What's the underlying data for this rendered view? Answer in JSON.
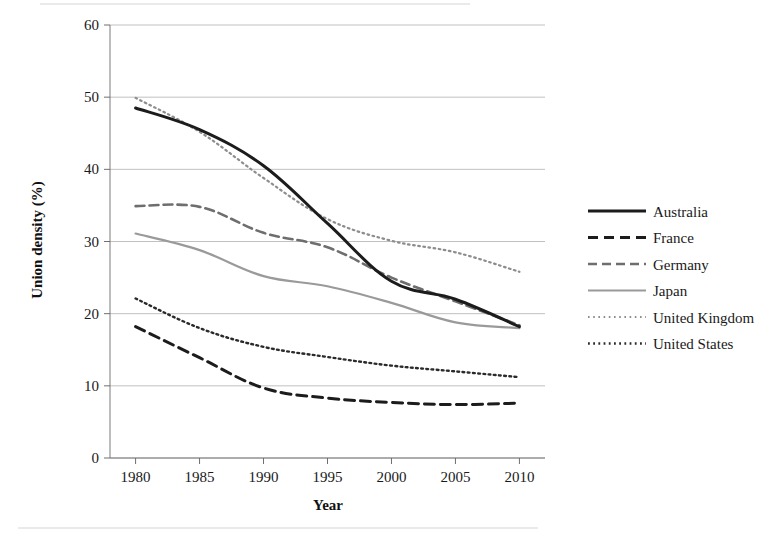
{
  "chart_data": {
    "type": "line",
    "title": "",
    "xlabel": "Year",
    "ylabel": "Union density (%)",
    "x": [
      1980,
      1985,
      1990,
      1995,
      2000,
      2005,
      2010
    ],
    "xlim": [
      1978,
      2012
    ],
    "ylim": [
      0,
      60
    ],
    "xticks": [
      "1980",
      "1985",
      "1990",
      "1995",
      "2000",
      "2005",
      "2010"
    ],
    "yticks": [
      "0",
      "10",
      "20",
      "30",
      "40",
      "50",
      "60"
    ],
    "grid": "horizontal",
    "legend_position": "right",
    "series": [
      {
        "name": "Australia",
        "values": [
          48.5,
          45.5,
          40.5,
          32.5,
          24.5,
          22.0,
          18.2
        ],
        "color": "#1c1c1c",
        "width": 3.0,
        "dash": "none"
      },
      {
        "name": "France",
        "values": [
          18.2,
          13.9,
          9.7,
          8.3,
          7.7,
          7.4,
          7.6
        ],
        "color": "#1c1c1c",
        "width": 3.0,
        "dash": "10 6"
      },
      {
        "name": "Germany",
        "values": [
          34.9,
          34.8,
          31.2,
          29.2,
          25.0,
          21.7,
          18.4
        ],
        "color": "#6e6e6e",
        "width": 2.6,
        "dash": "9 5"
      },
      {
        "name": "Japan",
        "values": [
          31.1,
          28.8,
          25.2,
          23.8,
          21.5,
          18.8,
          18.0
        ],
        "color": "#9a9a9a",
        "width": 2.2,
        "dash": "none"
      },
      {
        "name": "United Kingdom",
        "values": [
          49.9,
          45.2,
          38.8,
          33.1,
          30.1,
          28.5,
          25.8
        ],
        "color": "#8d8d8d",
        "width": 2.2,
        "dash": "1.6 3.6"
      },
      {
        "name": "United States",
        "values": [
          22.1,
          18.0,
          15.4,
          14.0,
          12.8,
          12.0,
          11.2
        ],
        "color": "#2a2a2a",
        "width": 2.4,
        "dash": "1.8 3.4"
      }
    ]
  },
  "legend": {
    "items": [
      {
        "label": "Australia"
      },
      {
        "label": "France"
      },
      {
        "label": "Germany"
      },
      {
        "label": "Japan"
      },
      {
        "label": "United Kingdom"
      },
      {
        "label": "United States"
      }
    ]
  },
  "axes": {
    "y_title": "Union density (%)",
    "x_title": "Year"
  }
}
